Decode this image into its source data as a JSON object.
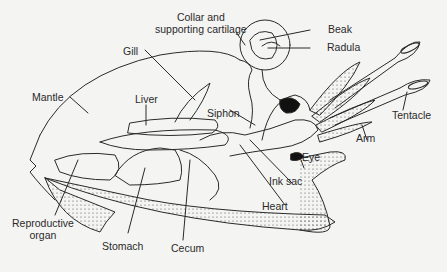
{
  "diagram": {
    "labels": {
      "collar": "Collar and\nsupporting cartilage",
      "collar_l1": "Collar and",
      "collar_l2": "supporting cartilage",
      "beak": "Beak",
      "radula": "Radula",
      "gill": "Gill",
      "mantle": "Mantle",
      "liver": "Liver",
      "siphon": "Siphon",
      "tentacle": "Tentacle",
      "arm": "Arm",
      "eye": "Eye",
      "ink_sac": "Ink sac",
      "heart": "Heart",
      "reproductive_l1": "Reproductive",
      "reproductive_l2": "organ",
      "stomach": "Stomach",
      "cecum": "Cecum"
    },
    "colors": {
      "line": "#2a2a2a",
      "background": "#f4f4f2",
      "eye": "#111111"
    }
  }
}
